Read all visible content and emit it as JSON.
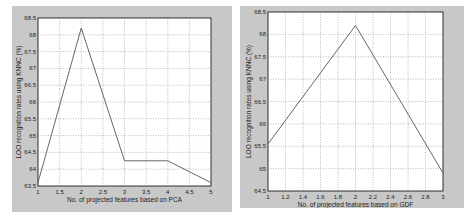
{
  "chart_data": [
    {
      "type": "line",
      "title": "",
      "xlabel": "No. of projected features based on PCA",
      "ylabel": "LOO recognition rates using KNNC (%)",
      "x": [
        1,
        2,
        3,
        4,
        5
      ],
      "series": [
        {
          "name": "LOO rate (PCA)",
          "values": [
            63.6,
            68.2,
            64.25,
            64.25,
            63.6
          ]
        }
      ],
      "xlim": [
        1,
        5
      ],
      "ylim": [
        63.5,
        68.5
      ],
      "xticks": [
        "1",
        "1.5",
        "2",
        "2.5",
        "3",
        "3.5",
        "4",
        "4.5",
        "5"
      ],
      "yticks": [
        "63.5",
        "64",
        "64.5",
        "65",
        "65.5",
        "66",
        "66.5",
        "67",
        "67.5",
        "68",
        "68.5"
      ],
      "grid": true,
      "line_color": "#555555"
    },
    {
      "type": "line",
      "title": "",
      "xlabel": "No. of projected features based on GDF",
      "ylabel": "LOO recognition rates using KNNC (%)",
      "x": [
        1,
        2,
        3
      ],
      "series": [
        {
          "name": "LOO rate (GDF)",
          "values": [
            65.55,
            68.2,
            64.9
          ]
        }
      ],
      "xlim": [
        1,
        3
      ],
      "ylim": [
        64.5,
        68.5
      ],
      "xticks": [
        "1",
        "1.2",
        "1.4",
        "1.6",
        "1.8",
        "2",
        "2.2",
        "2.4",
        "2.6",
        "2.8",
        "3"
      ],
      "yticks": [
        "64.5",
        "65",
        "65.5",
        "66",
        "66.5",
        "67",
        "67.5",
        "68",
        "68.5"
      ],
      "grid": true,
      "line_color": "#555555"
    }
  ]
}
